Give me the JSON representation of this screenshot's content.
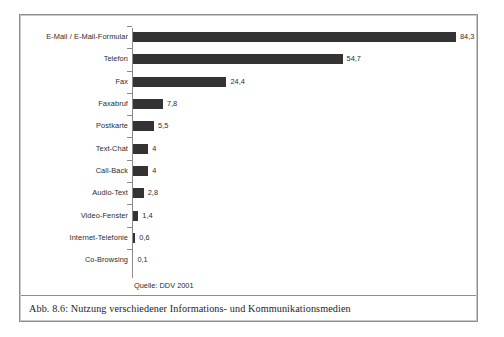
{
  "figure": {
    "caption": "Abb. 8.6: Nutzung verschiedener Informations- und Kommunikationsmedien",
    "source_note": "Quelle: DDV 2001",
    "frame_color": "#8e8e8e",
    "bar_color": "#333333",
    "axis_color": "#8a8a8a",
    "text_color": "#2b2b2b"
  },
  "chart_data": {
    "type": "bar",
    "orientation": "horizontal",
    "title": "",
    "subtitle": "",
    "xlabel": "",
    "ylabel": "",
    "xlim": [
      0,
      84.3
    ],
    "grid": false,
    "legend": false,
    "source": "Quelle: DDV 2001",
    "value_format": "german-decimal-comma",
    "categories": [
      "E-Mail / E-Mail-Formular",
      "Telefon",
      "Fax",
      "Faxabruf",
      "Postkarte",
      "Text-Chat",
      "Call-Back",
      "Audio-Text",
      "Video-Fenster",
      "Internet-Telefonie",
      "Co-Browsing"
    ],
    "values": [
      84.3,
      54.7,
      24.4,
      7.8,
      5.5,
      4,
      4,
      2.8,
      1.4,
      0.6,
      0.1
    ],
    "value_labels": [
      "84,3",
      "54,7",
      "24,4",
      "7,8",
      "5,5",
      "4",
      "4",
      "2,8",
      "1,4",
      "0,6",
      "0,1"
    ],
    "bars": [
      {
        "category": "E-Mail / E-Mail-Formular",
        "value": 84.3,
        "label": "84,3"
      },
      {
        "category": "Telefon",
        "value": 54.7,
        "label": "54,7"
      },
      {
        "category": "Fax",
        "value": 24.4,
        "label": "24,4"
      },
      {
        "category": "Faxabruf",
        "value": 7.8,
        "label": "7,8"
      },
      {
        "category": "Postkarte",
        "value": 5.5,
        "label": "5,5"
      },
      {
        "category": "Text-Chat",
        "value": 4,
        "label": "4"
      },
      {
        "category": "Call-Back",
        "value": 4,
        "label": "4"
      },
      {
        "category": "Audio-Text",
        "value": 2.8,
        "label": "2,8"
      },
      {
        "category": "Video-Fenster",
        "value": 1.4,
        "label": "1,4"
      },
      {
        "category": "Internet-Telefonie",
        "value": 0.6,
        "label": "0,6"
      },
      {
        "category": "Co-Browsing",
        "value": 0.1,
        "label": "0,1"
      }
    ]
  }
}
